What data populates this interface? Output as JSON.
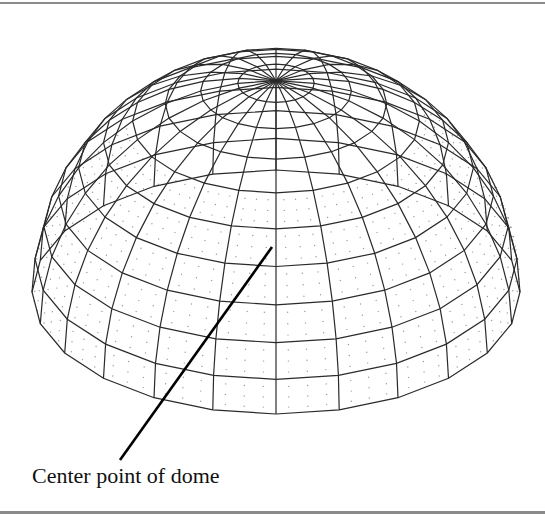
{
  "figure": {
    "caption_label": "Center point of dome",
    "colors": {
      "wire": "#2a2a2a",
      "leader": "#000000",
      "frame": "#8a8a8a",
      "dots": "#9a9a9a"
    }
  },
  "dome": {
    "center_x": 276,
    "center_y": 292,
    "radius": 244,
    "tilt_deg": 30,
    "meridian_count": 24,
    "ring_elevations_deg": [
      0,
      9,
      18,
      27,
      36,
      45,
      54,
      63,
      72,
      81
    ]
  },
  "leader_line": {
    "x1": 272,
    "y1": 247,
    "x2": 120,
    "y2": 460
  }
}
